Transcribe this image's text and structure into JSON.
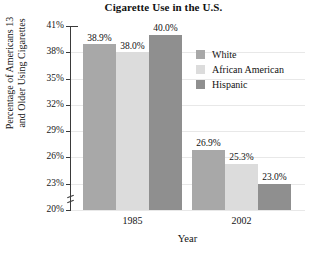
{
  "chart_data": {
    "type": "bar",
    "title": "Cigarette Use in the U.S.",
    "xlabel": "Year",
    "ylabel": "Percentage of Americans 13 and Older Using Cigarettes",
    "ylabel_line1": "Percentage of Americans 13",
    "ylabel_line2": "and Older Using Cigarettes",
    "categories": [
      "1985",
      "2002"
    ],
    "ylim": [
      20,
      41
    ],
    "ytick_labels": [
      "41%",
      "38%",
      "35%",
      "32%",
      "29%",
      "26%",
      "23%",
      "20%"
    ],
    "ytick_values": [
      41,
      38,
      35,
      32,
      29,
      26,
      23,
      20
    ],
    "y_axis_break": true,
    "grid": true,
    "legend_position": "upper-right-inside",
    "series": [
      {
        "name": "White",
        "color": "#a8a8a8",
        "values": [
          38.9,
          26.9
        ],
        "labels": [
          "38.9%",
          "26.9%"
        ]
      },
      {
        "name": "African American",
        "color": "#dcdcdc",
        "values": [
          38.0,
          25.3
        ],
        "labels": [
          "38.0%",
          "25.3%"
        ]
      },
      {
        "name": "Hispanic",
        "color": "#8f8f8f",
        "values": [
          40.0,
          23.0
        ],
        "labels": [
          "40.0%",
          "23.0%"
        ]
      }
    ]
  }
}
